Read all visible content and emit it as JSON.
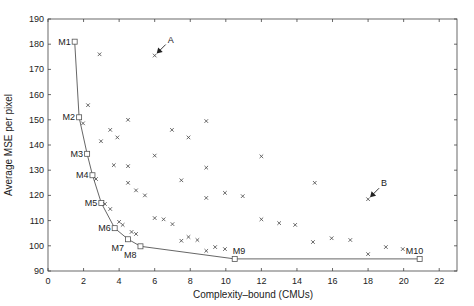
{
  "chart_data": {
    "type": "scatter",
    "title": "",
    "xlabel": "Complexity–bound (CMUs)",
    "ylabel": "Average MSE per pixel",
    "xlim": [
      0,
      23
    ],
    "ylim": [
      90,
      190
    ],
    "xticks": [
      0,
      2,
      4,
      6,
      8,
      10,
      12,
      14,
      16,
      18,
      20,
      22
    ],
    "yticks": [
      90,
      100,
      110,
      120,
      130,
      140,
      150,
      160,
      170,
      180,
      190
    ],
    "grid": false,
    "legend": null,
    "series": [
      {
        "name": "Pareto models",
        "style": "line+square",
        "points": [
          {
            "label": "M1",
            "x": 1.5,
            "y": 181
          },
          {
            "label": "M2",
            "x": 1.75,
            "y": 151
          },
          {
            "label": "M3",
            "x": 2.2,
            "y": 136.5
          },
          {
            "label": "M4",
            "x": 2.5,
            "y": 128
          },
          {
            "label": "M5",
            "x": 3.0,
            "y": 117
          },
          {
            "label": "M6",
            "x": 3.75,
            "y": 107
          },
          {
            "label": "M7",
            "x": 4.5,
            "y": 102.6
          },
          {
            "label": "M8",
            "x": 5.2,
            "y": 99.8
          },
          {
            "label": "M9",
            "x": 10.5,
            "y": 94.8
          },
          {
            "label": "M10",
            "x": 20.9,
            "y": 94.8
          }
        ]
      },
      {
        "name": "Other models",
        "style": "x",
        "points": [
          {
            "x": 2.9,
            "y": 176
          },
          {
            "x": 6.0,
            "y": 175.5
          },
          {
            "x": 2.25,
            "y": 155.8
          },
          {
            "x": 1.97,
            "y": 148.6
          },
          {
            "x": 4.5,
            "y": 150
          },
          {
            "x": 3.5,
            "y": 146
          },
          {
            "x": 3.9,
            "y": 143
          },
          {
            "x": 2.98,
            "y": 141.5
          },
          {
            "x": 6.97,
            "y": 146
          },
          {
            "x": 7.9,
            "y": 143
          },
          {
            "x": 8.9,
            "y": 149.5
          },
          {
            "x": 6.0,
            "y": 135.8
          },
          {
            "x": 3.7,
            "y": 132
          },
          {
            "x": 4.5,
            "y": 131.6
          },
          {
            "x": 2.7,
            "y": 126.5
          },
          {
            "x": 4.5,
            "y": 125
          },
          {
            "x": 7.5,
            "y": 126
          },
          {
            "x": 8.9,
            "y": 131
          },
          {
            "x": 12.0,
            "y": 135.5
          },
          {
            "x": 15.0,
            "y": 125
          },
          {
            "x": 4.95,
            "y": 122
          },
          {
            "x": 5.45,
            "y": 120
          },
          {
            "x": 3.2,
            "y": 116.6
          },
          {
            "x": 3.5,
            "y": 114.6
          },
          {
            "x": 6.0,
            "y": 111
          },
          {
            "x": 6.5,
            "y": 110.5
          },
          {
            "x": 7.0,
            "y": 108.6
          },
          {
            "x": 4.0,
            "y": 109.5
          },
          {
            "x": 4.2,
            "y": 108.3
          },
          {
            "x": 4.7,
            "y": 105.5
          },
          {
            "x": 4.95,
            "y": 104.7
          },
          {
            "x": 7.5,
            "y": 102
          },
          {
            "x": 7.9,
            "y": 103.5
          },
          {
            "x": 8.4,
            "y": 102.3
          },
          {
            "x": 8.9,
            "y": 98
          },
          {
            "x": 9.4,
            "y": 99.5
          },
          {
            "x": 9.95,
            "y": 98.7
          },
          {
            "x": 8.9,
            "y": 119
          },
          {
            "x": 9.95,
            "y": 121
          },
          {
            "x": 10.95,
            "y": 119.7
          },
          {
            "x": 12.0,
            "y": 110.5
          },
          {
            "x": 13.0,
            "y": 109
          },
          {
            "x": 13.9,
            "y": 108.3
          },
          {
            "x": 14.9,
            "y": 101.5
          },
          {
            "x": 15.95,
            "y": 103
          },
          {
            "x": 17.0,
            "y": 102.3
          },
          {
            "x": 18.0,
            "y": 118.5
          },
          {
            "x": 18.0,
            "y": 96.7
          },
          {
            "x": 19.0,
            "y": 99.5
          },
          {
            "x": 19.95,
            "y": 98.7
          }
        ]
      }
    ],
    "annotations": [
      {
        "text": "A",
        "x": 6.0,
        "y": 175.5,
        "arrow": true
      },
      {
        "text": "B",
        "x": 18.0,
        "y": 118.5,
        "arrow": true
      }
    ]
  }
}
